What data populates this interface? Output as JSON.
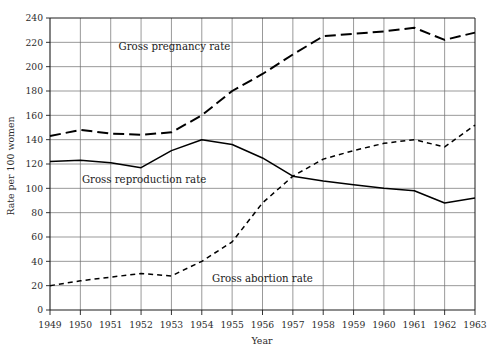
{
  "chart_data": {
    "type": "line",
    "title": "",
    "xlabel": "Year",
    "ylabel": "Rate per 100 women",
    "x": [
      1949,
      1950,
      1951,
      1952,
      1953,
      1954,
      1955,
      1956,
      1957,
      1958,
      1959,
      1960,
      1961,
      1962,
      1963
    ],
    "xtick_labels": [
      "1949",
      "1950",
      "1951",
      "1952",
      "1953",
      "1954",
      "1955",
      "1956",
      "1957",
      "1958",
      "1959",
      "1960",
      "1961",
      "1962",
      "1963"
    ],
    "ytick_labels": [
      "0",
      "20",
      "40",
      "60",
      "80",
      "100",
      "120",
      "140",
      "160",
      "180",
      "200",
      "220",
      "240"
    ],
    "ytick_values": [
      0,
      20,
      40,
      60,
      80,
      100,
      120,
      140,
      160,
      180,
      200,
      220,
      240
    ],
    "ylim": [
      0,
      240
    ],
    "xlim": [
      1949,
      1963
    ],
    "grid": true,
    "legend_position": "inline-annotations",
    "series": [
      {
        "name": "Gross pregnancy rate",
        "style": "long-dashed",
        "color": "#000000",
        "label_x": 1953.1,
        "label_y": 214,
        "values": [
          143,
          148,
          145,
          144,
          146,
          160,
          180,
          194,
          210,
          225,
          227,
          229,
          232,
          222,
          228
        ]
      },
      {
        "name": "Gross reproduction rate",
        "style": "solid",
        "color": "#000000",
        "label_x": 1952.1,
        "label_y": 104,
        "values": [
          122,
          123,
          121,
          117,
          131,
          140,
          136,
          125,
          110,
          106,
          103,
          100,
          98,
          88,
          92
        ]
      },
      {
        "name": "Gross abortion rate",
        "style": "short-dashed",
        "color": "#000000",
        "label_x": 1956.0,
        "label_y": 23,
        "values": [
          20,
          24,
          27,
          30,
          28,
          40,
          56,
          88,
          110,
          124,
          131,
          137,
          140,
          134,
          152
        ]
      }
    ]
  }
}
